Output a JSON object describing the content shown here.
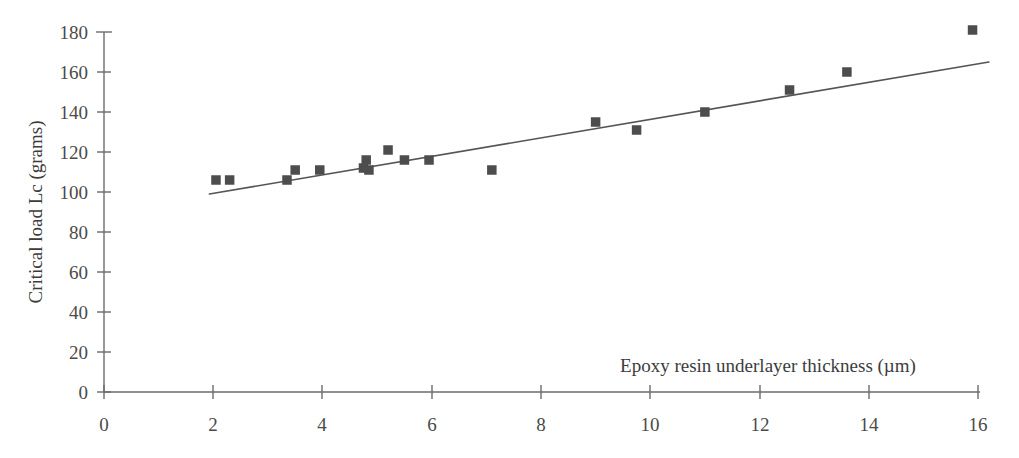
{
  "chart_data": {
    "type": "scatter",
    "title": "",
    "xlabel": "Epoxy resin underlayer thickness (µm)",
    "ylabel": "Critical load Lc (grams)",
    "xlim": [
      0,
      16
    ],
    "ylim": [
      0,
      180
    ],
    "xticks": [
      0,
      2,
      4,
      6,
      8,
      10,
      12,
      14,
      16
    ],
    "yticks": [
      0,
      20,
      40,
      60,
      80,
      100,
      120,
      140,
      160,
      180
    ],
    "xtick_labels": [
      "0",
      "2",
      "4",
      "6",
      "8",
      "10",
      "12",
      "14",
      "16"
    ],
    "ytick_labels": [
      "0",
      "20",
      "40",
      "60",
      "80",
      "100",
      "120",
      "140",
      "160",
      "180"
    ],
    "grid": false,
    "legend": false,
    "marker_style": "square",
    "marker_color": "#4d4d4d",
    "line_color": "#555555",
    "points": [
      {
        "x": 2.05,
        "y": 106
      },
      {
        "x": 2.3,
        "y": 106
      },
      {
        "x": 3.35,
        "y": 106
      },
      {
        "x": 3.5,
        "y": 111
      },
      {
        "x": 3.95,
        "y": 111
      },
      {
        "x": 4.75,
        "y": 112
      },
      {
        "x": 4.8,
        "y": 116
      },
      {
        "x": 4.85,
        "y": 111
      },
      {
        "x": 5.2,
        "y": 121
      },
      {
        "x": 5.5,
        "y": 116
      },
      {
        "x": 5.95,
        "y": 116
      },
      {
        "x": 7.1,
        "y": 111
      },
      {
        "x": 9.0,
        "y": 135
      },
      {
        "x": 9.75,
        "y": 131
      },
      {
        "x": 11.0,
        "y": 140
      },
      {
        "x": 12.55,
        "y": 151
      },
      {
        "x": 13.6,
        "y": 160
      },
      {
        "x": 15.9,
        "y": 181
      }
    ],
    "trend_line": {
      "label": "linear fit",
      "x_start": 1.93,
      "y_start": 99,
      "x_end": 16.2,
      "y_end": 165
    }
  },
  "figure": {
    "background_color": "#ffffff",
    "axis_color": "#6b6b6b",
    "text_color": "#3c3c3c"
  }
}
